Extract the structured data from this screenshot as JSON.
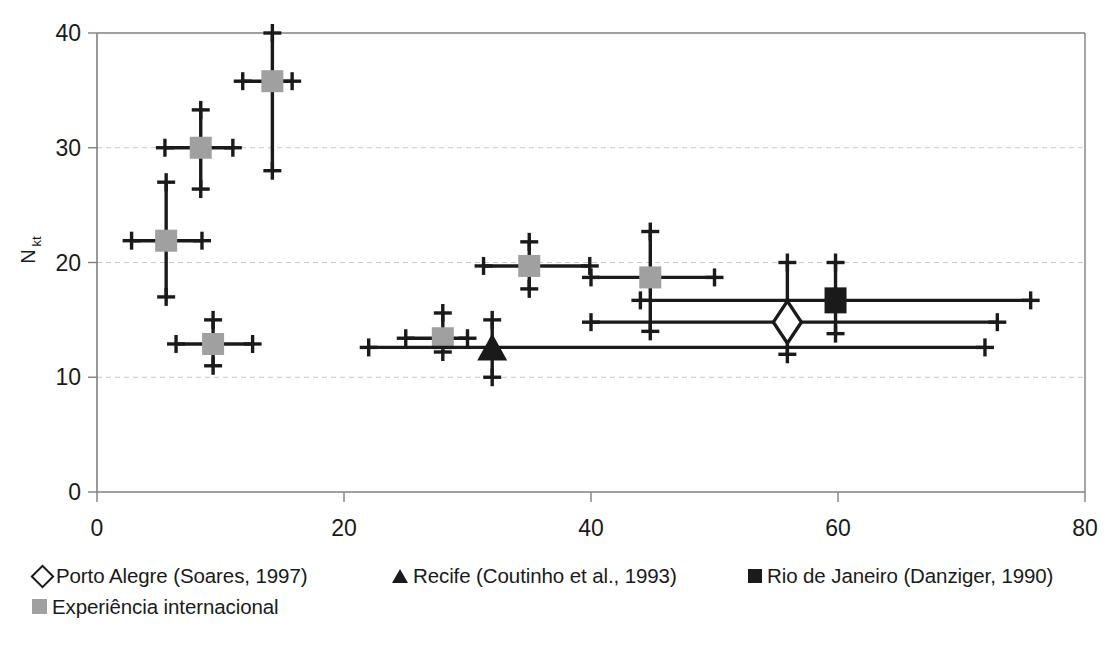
{
  "chart_data": {
    "type": "scatter",
    "title": "",
    "xlabel": "IP (%)",
    "ylabel": "Nkt",
    "ylabel_base": "N",
    "ylabel_sub": "kt",
    "xlim": [
      0,
      80
    ],
    "ylim": [
      0,
      40
    ],
    "xticks": [
      0,
      20,
      40,
      60,
      80
    ],
    "yticks": [
      0,
      10,
      20,
      30,
      40
    ],
    "grid": "horizontal-dashed",
    "colors": {
      "gray_marker": "#a0a0a0",
      "black_marker": "#1a1a1a",
      "axis": "#808080",
      "grid": "#c8c8c8"
    },
    "series": [
      {
        "name": "Experiência internacional",
        "marker": "square-gray",
        "points": [
          {
            "x": 5.6,
            "y": 21.9,
            "xerr": [
              2.8,
              8.5
            ],
            "yerr": [
              17.0,
              27.0
            ]
          },
          {
            "x": 8.4,
            "y": 30.0,
            "xerr": [
              5.5,
              11.0
            ],
            "yerr": [
              26.4,
              33.3
            ]
          },
          {
            "x": 14.2,
            "y": 35.8,
            "xerr": [
              11.8,
              15.8
            ],
            "yerr": [
              28.0,
              40.0
            ]
          },
          {
            "x": 9.4,
            "y": 12.9,
            "xerr": [
              6.4,
              12.6
            ],
            "yerr": [
              11.0,
              15.0
            ]
          },
          {
            "x": 28.0,
            "y": 13.4,
            "xerr": [
              25.0,
              30.0
            ],
            "yerr": [
              12.2,
              15.6
            ]
          },
          {
            "x": 35.0,
            "y": 19.7,
            "xerr": [
              31.3,
              39.9
            ],
            "yerr": [
              17.7,
              21.8
            ]
          },
          {
            "x": 44.8,
            "y": 18.7,
            "xerr": [
              40.0,
              50.0
            ],
            "yerr": [
              14.0,
              22.7
            ]
          }
        ]
      },
      {
        "name": "Porto Alegre (Soares, 1997)",
        "marker": "diamond-open",
        "points": [
          {
            "x": 55.9,
            "y": 14.8,
            "xerr": [
              40.0,
              72.9
            ],
            "yerr": [
              12.0,
              20.0
            ]
          }
        ]
      },
      {
        "name": "Recife (Coutinho et al., 1993)",
        "marker": "triangle-black",
        "points": [
          {
            "x": 32.0,
            "y": 12.6,
            "xerr": [
              22.0,
              71.9
            ],
            "yerr": [
              10.0,
              15.0
            ]
          }
        ]
      },
      {
        "name": "Rio de Janeiro (Danziger, 1990)",
        "marker": "square-black",
        "points": [
          {
            "x": 59.8,
            "y": 16.7,
            "xerr": [
              44.0,
              75.6
            ],
            "yerr": [
              13.8,
              20.0
            ]
          }
        ]
      }
    ]
  },
  "axes": {
    "x_title": "IP (%)",
    "y_title_base": "N",
    "y_title_sub": "kt",
    "xtick_labels": [
      "0",
      "20",
      "40",
      "60",
      "80"
    ],
    "ytick_labels": [
      "0",
      "10",
      "20",
      "30",
      "40"
    ]
  },
  "legend": {
    "row1": [
      {
        "label": "Porto Alegre (Soares, 1997)",
        "marker": "diamond-open-icon"
      },
      {
        "label": "Recife (Coutinho et al., 1993)",
        "marker": "triangle-black-icon"
      },
      {
        "label": "Rio de Janeiro (Danziger, 1990)",
        "marker": "square-black-icon"
      }
    ],
    "row2": [
      {
        "label": "Experiência internacional",
        "marker": "square-gray-icon"
      }
    ]
  }
}
